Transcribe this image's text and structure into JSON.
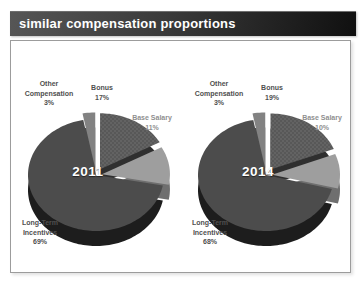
{
  "page": {
    "title": "similar compensation proportions",
    "background": "#ffffff",
    "header": {
      "grad_left": "#565656",
      "grad_right": "#101010",
      "text_color": "#ffffff"
    },
    "frame_border": "#9c9c9c"
  },
  "chart_data": [
    {
      "type": "pie",
      "year": "2011",
      "legend_position": "around-slices",
      "slices": [
        {
          "name": "Bonus",
          "pct": 17,
          "pct_label": "17%",
          "color": "#585858",
          "shade": "#2f2f2f",
          "dot_color": "#707070",
          "textured": true,
          "explode": 8
        },
        {
          "name": "Base Salary",
          "pct": 11,
          "pct_label": "11%",
          "color": "#9e9e9e",
          "shade": "#6f6f6f",
          "textured": false,
          "explode": 6
        },
        {
          "name": "Long-Term Incentives",
          "pct": 69,
          "pct_label": "69%",
          "color": "#4c4c4c",
          "shade": "#1d1d1d",
          "textured": false,
          "explode": 0
        },
        {
          "name": "Other Compensation",
          "pct": 3,
          "pct_label": "3%",
          "color": "#828282",
          "shade": "#4d4d4d",
          "textured": false,
          "explode": 8
        }
      ]
    },
    {
      "type": "pie",
      "year": "2014",
      "legend_position": "around-slices",
      "slices": [
        {
          "name": "Bonus",
          "pct": 19,
          "pct_label": "19%",
          "color": "#585858",
          "shade": "#2f2f2f",
          "dot_color": "#707070",
          "textured": true,
          "explode": 8
        },
        {
          "name": "Base Salary",
          "pct": 10,
          "pct_label": "10%",
          "color": "#9e9e9e",
          "shade": "#6f6f6f",
          "textured": false,
          "explode": 6
        },
        {
          "name": "Long-Term Incentives",
          "pct": 68,
          "pct_label": "68%",
          "color": "#4c4c4c",
          "shade": "#1d1d1d",
          "textured": false,
          "explode": 0
        },
        {
          "name": "Other Compensation",
          "pct": 3,
          "pct_label": "3%",
          "color": "#828282",
          "shade": "#4d4d4d",
          "textured": false,
          "explode": 8
        }
      ]
    }
  ]
}
